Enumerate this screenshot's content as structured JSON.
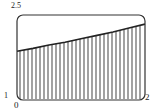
{
  "chart_data": {
    "type": "area",
    "title": "",
    "xlabel": "",
    "ylabel": "",
    "xlim": [
      0,
      2
    ],
    "ylim": [
      1,
      2.5
    ],
    "tick_labels": {
      "y_top": "2.5",
      "y_bottom": "1",
      "x_left": "0",
      "x_right": "2"
    },
    "grid": false,
    "legend": null,
    "fill_style": "vertical-hatch",
    "series": [
      {
        "name": "curve",
        "x": [
          0,
          0.25,
          0.5,
          0.75,
          1.0,
          1.25,
          1.5,
          1.75,
          2.0
        ],
        "y": [
          1.86,
          1.91,
          1.97,
          2.02,
          2.08,
          2.14,
          2.2,
          2.27,
          2.34
        ]
      }
    ],
    "frame": "rounded-rectangle"
  },
  "colors": {
    "line": "#222222",
    "hatch": "#555555",
    "frame": "#333333"
  }
}
